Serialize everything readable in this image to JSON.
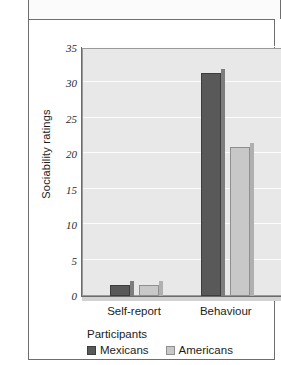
{
  "chart_data": {
    "type": "bar",
    "title": "",
    "subtitle": "",
    "xlabel": "",
    "ylabel": "Sociability ratings",
    "categories": [
      "Self-report",
      "Behaviour"
    ],
    "series": [
      {
        "name": "Mexicans",
        "values": [
          1.5,
          31.5
        ],
        "color": "#595959"
      },
      {
        "name": "Americans",
        "values": [
          1.5,
          21.0
        ],
        "color": "#c8c8c8"
      }
    ],
    "ylim": [
      0,
      35
    ],
    "yticks": [
      0,
      5,
      10,
      15,
      20,
      25,
      30,
      35
    ],
    "ytick_labels": [
      "0",
      "5",
      "10",
      "15",
      "20",
      "25",
      "30",
      "35"
    ],
    "grid": true,
    "grid_axis": "y",
    "legend": {
      "title": "Participants",
      "position": "bottom-left",
      "entries": [
        "Mexicans",
        "Americans"
      ]
    },
    "plot_background": "#e8e8e8",
    "gridline_color": "#fcfcfc"
  }
}
